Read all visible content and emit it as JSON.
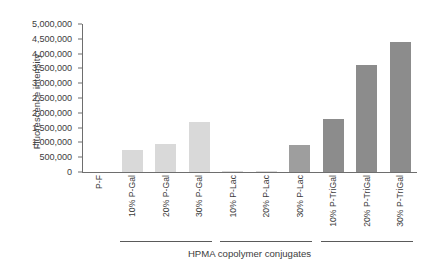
{
  "chart": {
    "type": "bar",
    "ylabel": "Fluorescence intensity",
    "xlabel": "HPMA copolymer conjugates"
  },
  "chart_data": {
    "type": "bar",
    "title": "",
    "subtitle": "",
    "xlabel": "HPMA copolymer conjugates",
    "ylabel": "Fluorescence intensity",
    "ylim": [
      0,
      5000000
    ],
    "grid": false,
    "legend": null,
    "ytick_labels": [
      "0",
      "500,000",
      "1,000,000",
      "1,500,000",
      "2,000,000",
      "2,500,000",
      "3,000,000",
      "3,500,000",
      "4,000,000",
      "4,500,000",
      "5,000,000"
    ],
    "ytick_values": [
      0,
      500000,
      1000000,
      1500000,
      2000000,
      2500000,
      3000000,
      3500000,
      4000000,
      4500000,
      5000000
    ],
    "categories": [
      "P-F",
      "10% P-Gal",
      "20% P-Gal",
      "30% P-Gal",
      "10% P-Lac",
      "20% P-Lac",
      "30% P-Lac",
      "10% P-TriGal",
      "20% P-TriGal",
      "30% P-TriGal"
    ],
    "values": [
      0,
      750000,
      950000,
      1700000,
      40000,
      40000,
      900000,
      1800000,
      3600000,
      4400000
    ],
    "bar_colors": [
      "#ffffff",
      "#d9d9d9",
      "#d9d9d9",
      "#d9d9d9",
      "#d9d9d9",
      "#d9d9d9",
      "#9e9e9e",
      "#8c8c8c",
      "#8c8c8c",
      "#8c8c8c"
    ],
    "groups": [
      {
        "label": "",
        "start_index": 1,
        "end_index": 3
      },
      {
        "label": "",
        "start_index": 4,
        "end_index": 6
      },
      {
        "label": "",
        "start_index": 7,
        "end_index": 9
      }
    ]
  },
  "colors": {
    "axis": "#6e6e6e",
    "text": "#3d3d3d",
    "light_bar": "#d9d9d9",
    "dark_bar": "#8c8c8c",
    "background": "#ffffff"
  }
}
